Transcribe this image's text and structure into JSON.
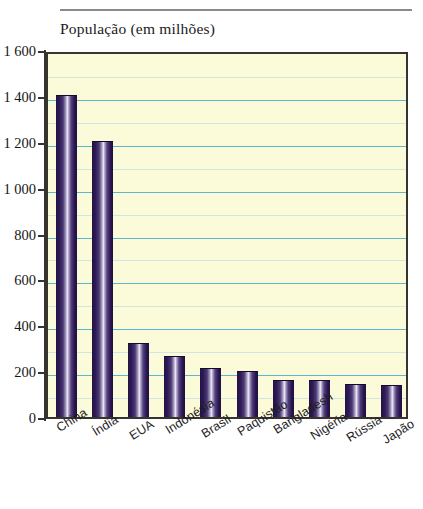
{
  "chart_data": {
    "type": "bar",
    "title": "População (em milhões)",
    "xlabel": "",
    "ylabel": "",
    "ylim": [
      0,
      1600
    ],
    "ytick_step": 200,
    "minor_gridline_step": 100,
    "grid": true,
    "legend": "none",
    "categories": [
      "China",
      "Índia",
      "EUA",
      "Indonésia",
      "Brasil",
      "Paquistão",
      "Bangladesh",
      "Nigéria",
      "Rússia",
      "Japão"
    ],
    "values": [
      1400,
      1200,
      320,
      260,
      210,
      195,
      155,
      155,
      140,
      135
    ],
    "ytick_labels": [
      "0",
      "200",
      "400",
      "600",
      "800",
      "1 000",
      "1 200",
      "1 400",
      "1 600"
    ],
    "ytick_values": [
      0,
      200,
      400,
      600,
      800,
      1000,
      1200,
      1400,
      1600
    ],
    "colors": {
      "plot_background": "#fbfad9",
      "bar_dark": "#241245",
      "bar_highlight": "#efeaf5",
      "major_gridline": "#5fb7cf",
      "minor_gridline": "#cfe6e4",
      "axis": "#37332e",
      "text": "#161616",
      "rule": "#8a8a8a"
    }
  }
}
